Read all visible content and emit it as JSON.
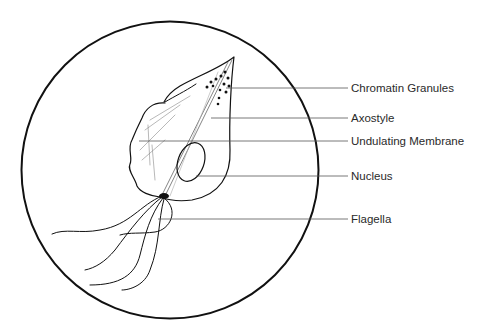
{
  "diagram": {
    "colors": {
      "ink": "#111111",
      "leader": "#555555",
      "text": "#2a2a2a",
      "background": "#ffffff"
    },
    "labels": [
      {
        "id": "chromatin",
        "text": "Chromatin Granules",
        "y": 88
      },
      {
        "id": "axostyle",
        "text": "Axostyle",
        "y": 118
      },
      {
        "id": "undulating",
        "text": "Undulating Membrane",
        "y": 141
      },
      {
        "id": "nucleus",
        "text": "Nucleus",
        "y": 176
      },
      {
        "id": "flagella",
        "text": "Flagella",
        "y": 219
      }
    ]
  }
}
